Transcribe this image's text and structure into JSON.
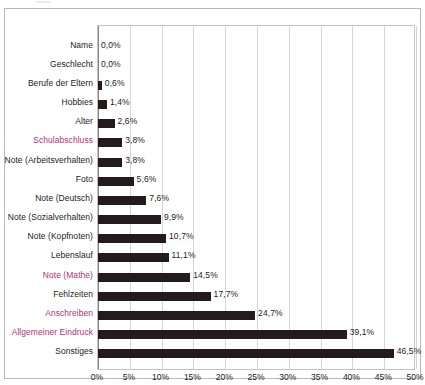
{
  "chart_data": {
    "type": "bar",
    "orientation": "horizontal",
    "title": "",
    "xlabel": "",
    "ylabel": "",
    "xlim": [
      0,
      50
    ],
    "grid": true,
    "legend": null,
    "value_suffix": "%",
    "decimal_separator": ",",
    "categories": [
      "Name",
      "Geschlecht",
      "Berufe der Eltern",
      "Hobbies",
      "Alter",
      "Schulabschluss",
      "Note (Arbeitsverhalten)",
      "Foto",
      "Note (Deutsch)",
      "Note (Sozialverhalten)",
      "Note (Kopfnoten)",
      "Lebenslauf",
      "Note (Mathe)",
      "Fehlzeiten",
      "Anschreiben",
      "Allgemeiner Eindruck",
      "Sonstiges"
    ],
    "values": [
      0.0,
      0.0,
      0.6,
      1.4,
      2.6,
      3.8,
      3.8,
      5.6,
      7.6,
      9.9,
      10.7,
      11.1,
      14.5,
      17.7,
      24.7,
      39.1,
      46.5
    ],
    "value_labels": [
      "0,0%",
      "0,0%",
      "0,6%",
      "1,4%",
      "2,6%",
      "3,8%",
      "3,8%",
      "5,6%",
      "7,6%",
      "9,9%",
      "10,7%",
      "11,1%",
      "14,5%",
      "17,7%",
      "24,7%",
      "39,1%",
      "46,5%"
    ],
    "highlighted_categories": [
      "Schulabschluss",
      "Note (Mathe)",
      "Anschreiben",
      "Allgemeiner Eindruck"
    ],
    "xticks": [
      0,
      5,
      10,
      15,
      20,
      25,
      30,
      35,
      40,
      45,
      50
    ],
    "xtick_labels": [
      "0%",
      "5%",
      "10%",
      "15%",
      "20%",
      "25%",
      "30%",
      "35%",
      "40%",
      "45%",
      "50%"
    ],
    "colors": {
      "bar": "#241c1c",
      "highlight_label": "#b3306e",
      "label": "#1c1c1c",
      "gridline": "#d6d6d6",
      "axis": "#8a8a8a",
      "frame": "#b9b9b9"
    }
  }
}
